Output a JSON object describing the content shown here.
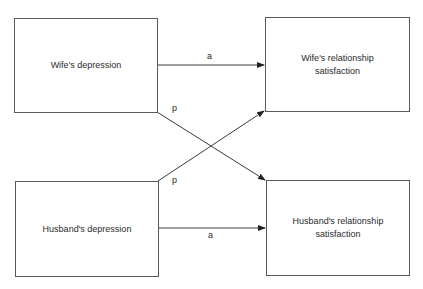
{
  "diagram": {
    "type": "path-model",
    "nodes": [
      {
        "id": "wife_depression",
        "label": "Wife's depression"
      },
      {
        "id": "wife_satisfaction",
        "label": "Wife's relationship satisfaction"
      },
      {
        "id": "husband_depression",
        "label": "Husband's depression"
      },
      {
        "id": "husband_satisfaction",
        "label": "Husband's relationship satisfaction"
      }
    ],
    "edges": [
      {
        "from": "wife_depression",
        "to": "wife_satisfaction",
        "label": "a"
      },
      {
        "from": "wife_depression",
        "to": "husband_satisfaction",
        "label": "p"
      },
      {
        "from": "husband_depression",
        "to": "wife_satisfaction",
        "label": "p"
      },
      {
        "from": "husband_depression",
        "to": "husband_satisfaction",
        "label": "a"
      }
    ],
    "colors": {
      "line": "#3a3a3a",
      "border": "#5a5a5a",
      "text": "#2a2a2a"
    }
  }
}
